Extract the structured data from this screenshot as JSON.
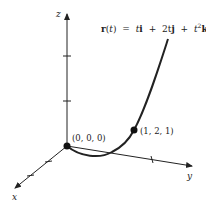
{
  "diagram": {
    "type": "3d-space-curve",
    "formula": {
      "lhs": "r(t)",
      "eq": "=",
      "term1_coef": "t",
      "term1_vec": "i",
      "plus1": "+",
      "term2_coef": "2t",
      "term2_vec": "j",
      "plus2": "+",
      "term3_coef": "t",
      "term3_exp": "2",
      "term3_vec": "k"
    },
    "axes": {
      "x_label": "x",
      "y_label": "y",
      "z_label": "z"
    },
    "points": [
      {
        "label": "(0, 0, 0)"
      },
      {
        "label": "(1, 2, 1)"
      }
    ],
    "colors": {
      "stroke": "#222222",
      "background": "#ffffff"
    }
  }
}
